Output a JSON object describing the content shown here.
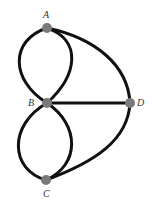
{
  "diagram": {
    "type": "multigraph",
    "colors": {
      "edge": "#111111",
      "node": "#7a7a7a",
      "label": "#333333",
      "background": "#ffffff"
    },
    "nodes": [
      {
        "id": "A",
        "label": "A",
        "x": 47,
        "y": 28
      },
      {
        "id": "B",
        "label": "B",
        "x": 47,
        "y": 103
      },
      {
        "id": "C",
        "label": "C",
        "x": 46,
        "y": 180
      },
      {
        "id": "D",
        "label": "D",
        "x": 130,
        "y": 103
      }
    ],
    "edges": [
      {
        "from": "A",
        "to": "B",
        "shape": "curve-left"
      },
      {
        "from": "A",
        "to": "B",
        "shape": "curve-right"
      },
      {
        "from": "A",
        "to": "D",
        "shape": "curve"
      },
      {
        "from": "B",
        "to": "D",
        "shape": "straight"
      },
      {
        "from": "B",
        "to": "C",
        "shape": "curve-left"
      },
      {
        "from": "B",
        "to": "C",
        "shape": "curve-right"
      },
      {
        "from": "C",
        "to": "D",
        "shape": "curve"
      }
    ]
  }
}
